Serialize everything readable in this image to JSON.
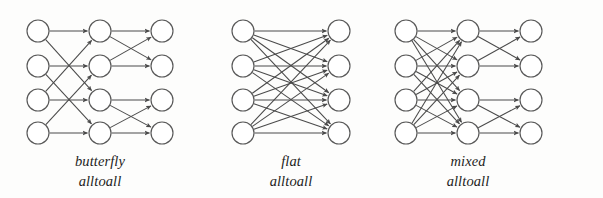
{
  "figure": {
    "kind": "network-topology-diagram",
    "background_color": "#fdfdfc",
    "line_color": "#4a4a4a",
    "node_stroke_color": "#585858",
    "node_fill_color": "#ffffff",
    "text_color": "#1d1d1d",
    "node_radius": 11,
    "rows_y": [
      31,
      66,
      100,
      133
    ],
    "panels": [
      {
        "id": "butterfly",
        "caption_line1": "butterfly",
        "caption_line2": "alltoall",
        "caption_x": 100,
        "columns_x": [
          38,
          100,
          162
        ],
        "num_rows": 4,
        "stages": [
          {
            "name": "butterfly-distance-2",
            "from_col": 0,
            "to_col": 1,
            "edges": [
              [
                0,
                0
              ],
              [
                0,
                2
              ],
              [
                1,
                1
              ],
              [
                1,
                3
              ],
              [
                2,
                2
              ],
              [
                2,
                0
              ],
              [
                3,
                3
              ],
              [
                3,
                1
              ]
            ]
          },
          {
            "name": "butterfly-distance-1",
            "from_col": 1,
            "to_col": 2,
            "edges": [
              [
                0,
                0
              ],
              [
                0,
                1
              ],
              [
                1,
                1
              ],
              [
                1,
                0
              ],
              [
                2,
                2
              ],
              [
                2,
                3
              ],
              [
                3,
                3
              ],
              [
                3,
                2
              ]
            ]
          }
        ]
      },
      {
        "id": "flat",
        "caption_line1": "flat",
        "caption_line2": "alltoall",
        "caption_x": 291,
        "columns_x": [
          243,
          339
        ],
        "num_rows": 4,
        "stages": [
          {
            "name": "full-all-to-all",
            "from_col": 0,
            "to_col": 1,
            "edges": [
              [
                0,
                0
              ],
              [
                0,
                1
              ],
              [
                0,
                2
              ],
              [
                0,
                3
              ],
              [
                1,
                0
              ],
              [
                1,
                1
              ],
              [
                1,
                2
              ],
              [
                1,
                3
              ],
              [
                2,
                0
              ],
              [
                2,
                1
              ],
              [
                2,
                2
              ],
              [
                2,
                3
              ],
              [
                3,
                0
              ],
              [
                3,
                1
              ],
              [
                3,
                2
              ],
              [
                3,
                3
              ]
            ]
          }
        ]
      },
      {
        "id": "mixed",
        "caption_line1": "mixed",
        "caption_line2": "alltoall",
        "caption_x": 468,
        "columns_x": [
          406,
          468,
          531
        ],
        "num_rows": 4,
        "stages": [
          {
            "name": "full-all-to-all",
            "from_col": 0,
            "to_col": 1,
            "edges": [
              [
                0,
                0
              ],
              [
                0,
                1
              ],
              [
                0,
                2
              ],
              [
                0,
                3
              ],
              [
                1,
                0
              ],
              [
                1,
                1
              ],
              [
                1,
                2
              ],
              [
                1,
                3
              ],
              [
                2,
                0
              ],
              [
                2,
                1
              ],
              [
                2,
                2
              ],
              [
                2,
                3
              ],
              [
                3,
                0
              ],
              [
                3,
                1
              ],
              [
                3,
                2
              ],
              [
                3,
                3
              ]
            ]
          },
          {
            "name": "butterfly-distance-1",
            "from_col": 1,
            "to_col": 2,
            "edges": [
              [
                0,
                0
              ],
              [
                0,
                1
              ],
              [
                1,
                1
              ],
              [
                1,
                0
              ],
              [
                2,
                2
              ],
              [
                2,
                3
              ],
              [
                3,
                3
              ],
              [
                3,
                2
              ]
            ]
          }
        ]
      }
    ]
  },
  "chart_data": {
    "type": "diagram",
    "title": "",
    "panel_labels": [
      "butterfly alltoall",
      "flat alltoall",
      "mixed alltoall"
    ],
    "nodes_per_column": 4,
    "columns_per_panel": [
      3,
      2,
      3
    ],
    "edge_counts_per_panel": [
      16,
      16,
      24
    ],
    "edge_directionality": "left-to-right, arrowheads at destination"
  }
}
